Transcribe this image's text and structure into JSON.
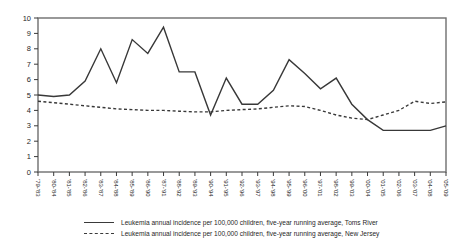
{
  "chart_data": {
    "type": "line",
    "title": "",
    "xlabel": "",
    "ylabel": "",
    "ylim": [
      0,
      10
    ],
    "yticks": [
      0,
      1,
      2,
      3,
      4,
      5,
      6,
      7,
      8,
      9,
      10
    ],
    "grid": false,
    "legend_position": "bottom",
    "line_color": "#383838",
    "frame_color": "#6e6e6e",
    "tick_color": "#3a3a3a",
    "label_color": "#1f1f1f",
    "categories": [
      "'79-'83",
      "'80-'84",
      "'81-'85",
      "'82-'86",
      "'83-'87",
      "'84-'88",
      "'85-'89",
      "'86-'90",
      "'87-'91",
      "'88-'92",
      "'89-'93",
      "'90-'94",
      "'91-'95",
      "'92-'96",
      "'93-'97",
      "'94-'98",
      "'95-'99",
      "'96-'00",
      "'97-'01",
      "'98-'02",
      "'99-'03",
      "'00-'04",
      "'01-'05",
      "'02-'06",
      "'03-'07",
      "'04-'08",
      "'05-'09"
    ],
    "series": [
      {
        "name": "Leukemia annual incidence per 100,000 children, five-year running average, Toms River",
        "style": "solid",
        "values": [
          5.0,
          4.9,
          5.0,
          5.9,
          8.0,
          5.8,
          8.6,
          7.7,
          9.4,
          6.5,
          6.5,
          3.7,
          6.1,
          4.4,
          4.4,
          5.3,
          7.3,
          6.4,
          5.4,
          6.1,
          4.4,
          3.4,
          2.7,
          2.7,
          2.7,
          2.7,
          3.0
        ]
      },
      {
        "name": "Leukemia annual incidence per 100,000 children, five-year running average, New Jersey",
        "style": "dashed",
        "values": [
          4.6,
          4.5,
          4.4,
          4.3,
          4.2,
          4.1,
          4.05,
          4.0,
          4.0,
          3.95,
          3.9,
          3.9,
          4.0,
          4.05,
          4.1,
          4.2,
          4.3,
          4.25,
          4.0,
          3.7,
          3.5,
          3.4,
          3.7,
          4.0,
          4.6,
          4.45,
          4.55
        ]
      }
    ]
  },
  "legend": {
    "toms_river_label": "Leukemia annual incidence per 100,000 children, five-year running average, Toms River",
    "new_jersey_label": "Leukemia annual incidence per 100,000 children, five-year running average, New Jersey"
  }
}
